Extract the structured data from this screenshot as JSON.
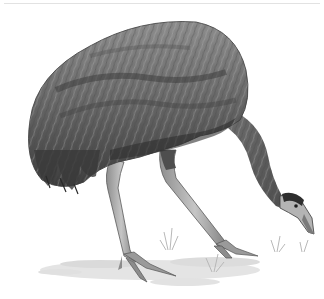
{
  "image": {
    "subject": "Emu",
    "description": "Grayscale pencil illustration of an emu bending forward, head lowered to the ground, standing on long scaly legs over sparse grass",
    "style": "grayscale pencil illustration",
    "background_color": "#ffffff"
  },
  "colors": {
    "plumage_dark": "#3a3a3a",
    "plumage_mid": "#6e6e6e",
    "plumage_light": "#9a9a9a",
    "legs": "#a8a8a8",
    "leg_shadow": "#6a6a6a",
    "neck": "#8a8a8a",
    "head": "#b5b5b5",
    "ground": "#d8d8d8",
    "grass": "#c4c4c4",
    "rule": "#e2e2e2"
  }
}
